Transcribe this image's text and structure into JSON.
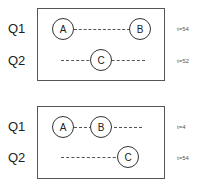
{
  "panels": [
    {
      "rows": [
        {
          "label": "Q1",
          "time": "t=54",
          "nodes": [
            "A",
            "B"
          ]
        },
        {
          "label": "Q2",
          "time": "t=52",
          "nodes": [
            "C"
          ]
        }
      ]
    },
    {
      "rows": [
        {
          "label": "Q1",
          "time": "t=4",
          "nodes": [
            "A",
            "B"
          ]
        },
        {
          "label": "Q2",
          "time": "t=54",
          "nodes": [
            "C"
          ]
        }
      ]
    }
  ]
}
